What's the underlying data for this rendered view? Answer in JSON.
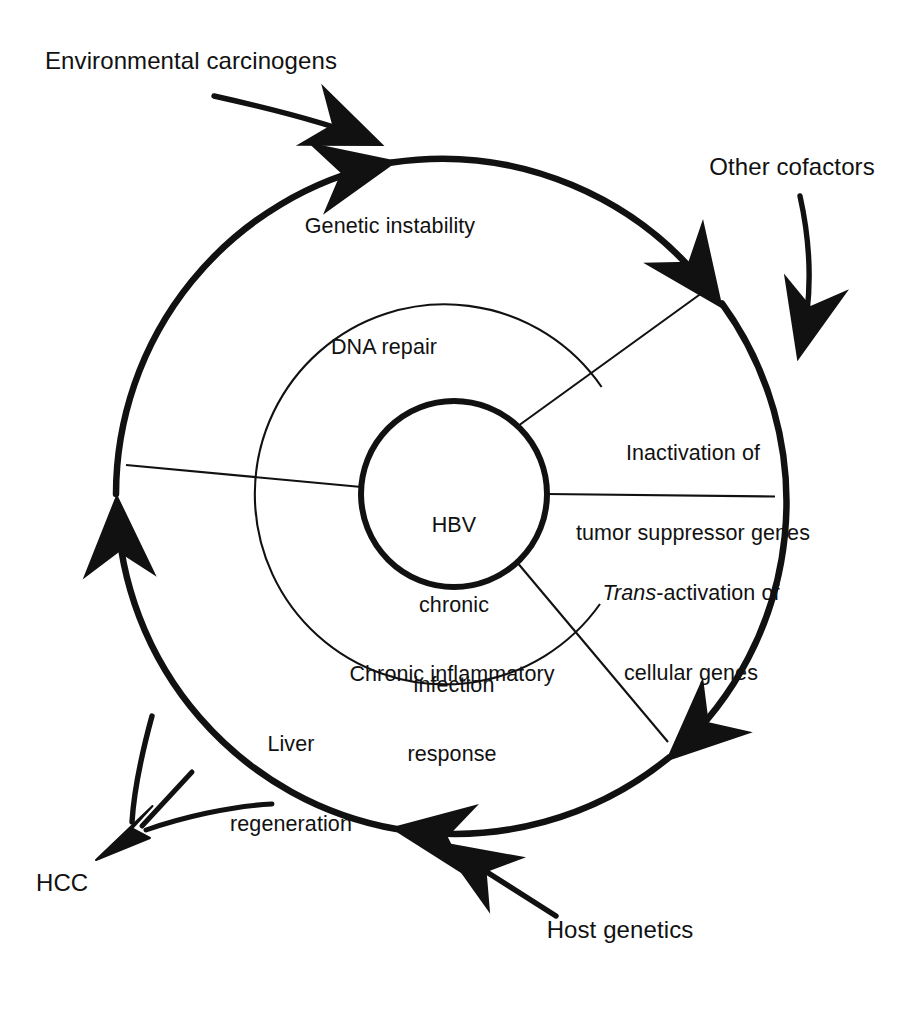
{
  "figure": {
    "type": "concentric-cycle-diagram",
    "title_text_present": false,
    "background_color": "#ffffff",
    "stroke_color": "#111111"
  },
  "core": {
    "line1": "HBV",
    "line2": "chronic",
    "line3": "infection"
  },
  "inner_ring": {
    "items": [
      {
        "name": "dna-repair",
        "line1": "DNA repair",
        "line2": ""
      },
      {
        "name": "chronic-inflammatory-response",
        "line1": "Chronic inflammatory",
        "line2": "response"
      }
    ]
  },
  "outer_ring": {
    "items": [
      {
        "name": "genetic-instability",
        "line1": "Genetic instability",
        "line2": ""
      },
      {
        "name": "liver-regeneration",
        "line1": "Liver",
        "line2": "regeneration"
      }
    ]
  },
  "right_sectors": {
    "items": [
      {
        "name": "inactivation-of-tumor-suppressor-genes",
        "line1": "Inactivation of",
        "line2": "tumor suppressor genes",
        "italic_prefix": ""
      },
      {
        "name": "trans-activation-of-cellular-genes",
        "italic_prefix": "Trans",
        "line1_rest": "-activation of",
        "line2": "cellular genes"
      }
    ]
  },
  "external_inputs": [
    {
      "name": "environmental-carcinogens",
      "label": "Environmental carcinogens"
    },
    {
      "name": "other-cofactors",
      "label": "Other cofactors"
    },
    {
      "name": "host-genetics",
      "label": "Host genetics"
    }
  ],
  "outcome": {
    "name": "hcc",
    "label": "HCC"
  },
  "geometry": {
    "center_x": 454,
    "center_y": 494,
    "outer_radius": 338,
    "middle_radius": 190,
    "core_radius": 93
  }
}
